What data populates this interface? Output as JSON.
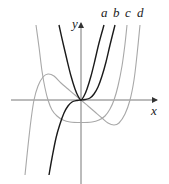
{
  "chart_data": {
    "type": "line",
    "title": "",
    "xlabel": "x",
    "ylabel": "y",
    "grid": false,
    "axes": {
      "origin_px": [
        81,
        100
      ],
      "x_axis_px": [
        11,
        158
      ],
      "y_axis_px": [
        23,
        184
      ]
    },
    "series": [
      {
        "name": "a",
        "shade": "dark",
        "color": "#1a1a1a",
        "description": "even curve (parabola-like) through origin",
        "points": [
          [
            59,
            25
          ],
          [
            63,
            43
          ],
          [
            67,
            60
          ],
          [
            71,
            76
          ],
          [
            75,
            89
          ],
          [
            78,
            96
          ],
          [
            81,
            100
          ],
          [
            84,
            96
          ],
          [
            87,
            89
          ],
          [
            91,
            76
          ],
          [
            95,
            60
          ],
          [
            99,
            43
          ],
          [
            104,
            25
          ]
        ]
      },
      {
        "name": "b",
        "shade": "dark",
        "color": "#1a1a1a",
        "description": "odd cubic through origin",
        "points": [
          [
            49,
            175
          ],
          [
            52,
            158
          ],
          [
            56,
            138
          ],
          [
            60,
            124
          ],
          [
            64,
            113
          ],
          [
            68,
            106
          ],
          [
            72,
            102
          ],
          [
            77,
            100.5
          ],
          [
            81,
            100
          ],
          [
            85,
            99.5
          ],
          [
            90,
            98
          ],
          [
            94,
            94
          ],
          [
            98,
            87
          ],
          [
            102,
            76
          ],
          [
            106,
            62
          ],
          [
            110,
            45
          ],
          [
            115,
            25
          ]
        ]
      },
      {
        "name": "c",
        "shade": "light",
        "color": "#a8a8a8",
        "description": "even quartic-like with minimum below x-axis",
        "points": [
          [
            36,
            25
          ],
          [
            39,
            47
          ],
          [
            42,
            71
          ],
          [
            45,
            88
          ],
          [
            48,
            100
          ],
          [
            52,
            110
          ],
          [
            57,
            116
          ],
          [
            63,
            120
          ],
          [
            70,
            122
          ],
          [
            81,
            122.5
          ],
          [
            92,
            122
          ],
          [
            99,
            120
          ],
          [
            105,
            116
          ],
          [
            110,
            109
          ],
          [
            114,
            100
          ],
          [
            118,
            86
          ],
          [
            122,
            66
          ],
          [
            125,
            44
          ],
          [
            127,
            25
          ]
        ]
      },
      {
        "name": "d",
        "shade": "light",
        "color": "#a8a8a8",
        "description": "odd curve with local max left of origin and local min right of origin",
        "points": [
          [
            25,
            175
          ],
          [
            28,
            146
          ],
          [
            31,
            120
          ],
          [
            34,
            100
          ],
          [
            38,
            86
          ],
          [
            43,
            77
          ],
          [
            48,
            74
          ],
          [
            54,
            76
          ],
          [
            61,
            83
          ],
          [
            68,
            89
          ],
          [
            75,
            95
          ],
          [
            81,
            100
          ],
          [
            88,
            106
          ],
          [
            95,
            112
          ],
          [
            102,
            118
          ],
          [
            108,
            123
          ],
          [
            114,
            125
          ],
          [
            119,
            123
          ],
          [
            125,
            114
          ],
          [
            130,
            100
          ],
          [
            134,
            80
          ],
          [
            137,
            55
          ],
          [
            140,
            25
          ]
        ]
      }
    ],
    "labels": [
      {
        "text": "a",
        "x": 101,
        "y": 6
      },
      {
        "text": "b",
        "x": 113,
        "y": 6
      },
      {
        "text": "c",
        "x": 125,
        "y": 6
      },
      {
        "text": "d",
        "x": 137,
        "y": 6
      },
      {
        "text": "y",
        "x": 72,
        "y": 17
      },
      {
        "text": "x",
        "x": 151,
        "y": 104
      }
    ]
  },
  "labels": {
    "a": "a",
    "b": "b",
    "c": "c",
    "d": "d",
    "x_axis": "x",
    "y_axis": "y"
  }
}
